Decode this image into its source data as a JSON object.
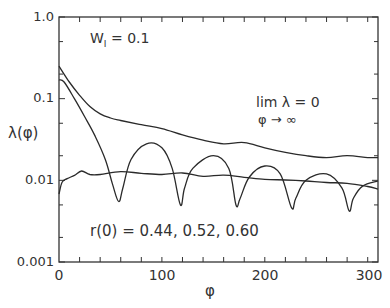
{
  "chart_data": {
    "type": "line",
    "title": "",
    "xlabel": "φ",
    "ylabel": "λ(φ)",
    "xscale": "linear",
    "yscale": "log",
    "xlim": [
      0,
      310
    ],
    "ylim": [
      0.001,
      1.0
    ],
    "grid": false,
    "legend": "none",
    "x_ticks": [
      0,
      100,
      200,
      300
    ],
    "x_tick_labels": [
      "0",
      "100",
      "200",
      "300"
    ],
    "y_ticks": [
      1.0,
      0.1,
      0.01,
      0.001
    ],
    "y_tick_labels": [
      "1.0",
      "0.1",
      "0.01",
      "0.001"
    ],
    "annotations": [
      {
        "text": "W_I = 0.1",
        "position": "upper-left"
      },
      {
        "text": "lim λ = 0",
        "subtext": "φ → ∞",
        "position": "upper-right"
      },
      {
        "text": "r(0) = 0.44, 0.52, 0.60",
        "position": "lower-center"
      }
    ],
    "series": [
      {
        "name": "r(0)=0.60 (upper)",
        "x": [
          0,
          10,
          20,
          30,
          40,
          50,
          60,
          80,
          100,
          120,
          140,
          160,
          180,
          200,
          220,
          240,
          260,
          280,
          300,
          310
        ],
        "y": [
          0.25,
          0.16,
          0.11,
          0.08,
          0.065,
          0.058,
          0.054,
          0.048,
          0.043,
          0.036,
          0.031,
          0.028,
          0.029,
          0.025,
          0.022,
          0.02,
          0.019,
          0.02,
          0.019,
          0.019
        ]
      },
      {
        "name": "r(0)=0.52 (oscillating)",
        "x": [
          0,
          5,
          15,
          25,
          35,
          45,
          52,
          58,
          62,
          70,
          85,
          100,
          110,
          118,
          122,
          130,
          150,
          165,
          172,
          176,
          185,
          200,
          215,
          226,
          230,
          240,
          260,
          275,
          282,
          286,
          295,
          310
        ],
        "y": [
          0.17,
          0.16,
          0.1,
          0.06,
          0.035,
          0.018,
          0.009,
          0.0055,
          0.008,
          0.018,
          0.028,
          0.025,
          0.014,
          0.005,
          0.008,
          0.014,
          0.02,
          0.014,
          0.005,
          0.006,
          0.011,
          0.015,
          0.012,
          0.0046,
          0.006,
          0.01,
          0.012,
          0.008,
          0.0042,
          0.006,
          0.0085,
          0.0098
        ]
      },
      {
        "name": "r(0)=0.44 (flat)",
        "x": [
          0,
          3,
          8,
          15,
          22,
          30,
          40,
          60,
          80,
          100,
          120,
          140,
          160,
          180,
          200,
          220,
          240,
          260,
          280,
          300,
          310
        ],
        "y": [
          0.0068,
          0.0095,
          0.0105,
          0.0115,
          0.013,
          0.0118,
          0.0118,
          0.0128,
          0.0122,
          0.0118,
          0.0123,
          0.0112,
          0.0116,
          0.0109,
          0.0103,
          0.0101,
          0.0098,
          0.0094,
          0.0092,
          0.0084,
          0.0078
        ]
      }
    ]
  },
  "labels": {
    "y_axis": "λ(φ)",
    "x_axis": "φ",
    "wi_main": "W",
    "wi_sub": "I",
    "wi_value": " = 0.1",
    "lim_line1": "lim λ = 0",
    "lim_line2": "φ → ∞",
    "r0": "r(0) = 0.44, 0.52, 0.60"
  }
}
